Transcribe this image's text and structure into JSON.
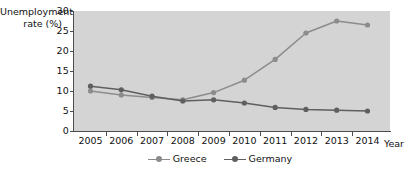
{
  "chart_data": {
    "type": "line",
    "title": "",
    "xlabel": "Year",
    "ylabel": "Unemployment rate (%)",
    "categories": [
      "2005",
      "2006",
      "2007",
      "2008",
      "2009",
      "2010",
      "2011",
      "2012",
      "2013",
      "2014"
    ],
    "x": [
      2005,
      2006,
      2007,
      2008,
      2009,
      2010,
      2011,
      2012,
      2013,
      2014
    ],
    "xlim": [
      2005,
      2014
    ],
    "ylim": [
      0,
      30
    ],
    "yticks": [
      0,
      5,
      10,
      15,
      20,
      25,
      30
    ],
    "grid": false,
    "legend_position": "bottom-center",
    "plot_background": "#d4d4d4",
    "series": [
      {
        "name": "Greece",
        "color": "#8c8c8c",
        "values": [
          10.0,
          9.0,
          8.4,
          7.8,
          9.6,
          12.7,
          17.9,
          24.5,
          27.5,
          26.5
        ]
      },
      {
        "name": "Germany",
        "color": "#5f5f5f",
        "values": [
          11.2,
          10.3,
          8.7,
          7.5,
          7.8,
          7.0,
          5.9,
          5.4,
          5.2,
          5.0
        ]
      }
    ]
  },
  "axes": {
    "y_title": "Unemployment\nrate (%)",
    "x_title": "Year",
    "y_tick_labels": [
      "30",
      "25",
      "20",
      "15",
      "10",
      "5",
      "0"
    ],
    "x_tick_labels": [
      "2005",
      "2006",
      "2007",
      "2008",
      "2009",
      "2010",
      "2011",
      "2012",
      "2013",
      "2014"
    ]
  },
  "legend": {
    "items": [
      {
        "label": "Greece",
        "color": "#8c8c8c"
      },
      {
        "label": "Germany",
        "color": "#5f5f5f"
      }
    ]
  }
}
